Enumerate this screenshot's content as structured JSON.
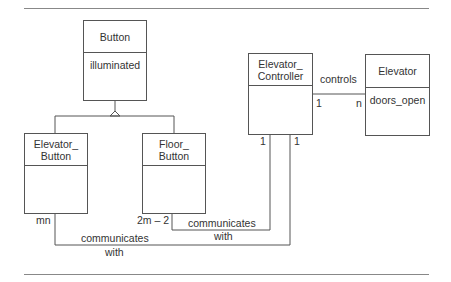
{
  "diagram": {
    "type": "UML class diagram",
    "classes": {
      "button": {
        "name": "Button",
        "attributes": "illuminated"
      },
      "elevator_button": {
        "name_line1": "Elevator_",
        "name_line2": "Button",
        "attributes": ""
      },
      "floor_button": {
        "name_line1": "Floor_",
        "name_line2": "Button",
        "attributes": ""
      },
      "elevator_controller": {
        "name_line1": "Elevator_",
        "name_line2": "Controller",
        "attributes": ""
      },
      "elevator": {
        "name": "Elevator",
        "attributes": "doors_open"
      }
    },
    "associations": {
      "controls": {
        "label": "controls",
        "mult_source": "1",
        "mult_target": "n"
      },
      "floor_comm": {
        "label_line1": "communicates",
        "label_line2": "with",
        "mult_source": "2m – 2",
        "mult_target": "1"
      },
      "elevator_comm": {
        "label_line1": "communicates",
        "label_line2": "with",
        "mult_source": "mn",
        "mult_target": "1"
      }
    },
    "colors": {
      "line": "#555555",
      "text": "#333333",
      "rule": "#888888"
    }
  }
}
